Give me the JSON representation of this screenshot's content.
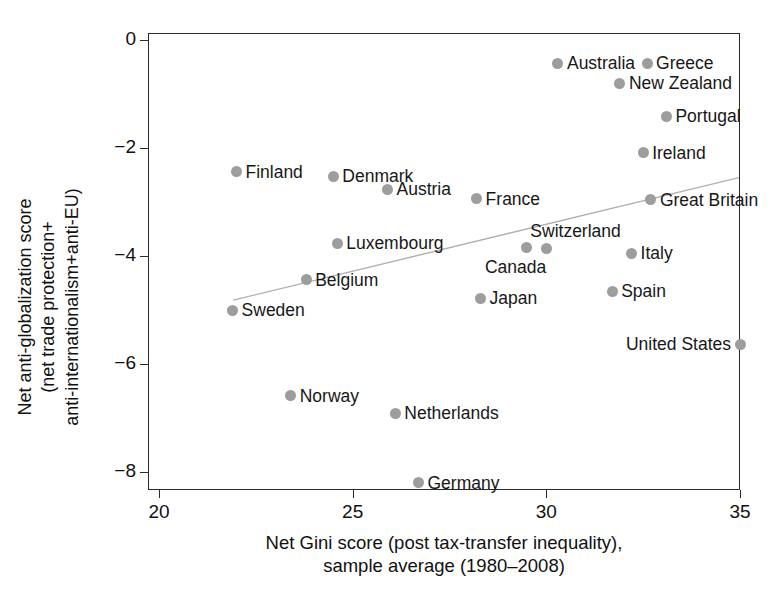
{
  "chart_data": {
    "type": "scatter",
    "title": "",
    "xlabel": "Net Gini score (post tax-transfer inequality),\nsample average (1980–2008)",
    "xlabel_line1": "Net Gini score (post tax-transfer inequality),",
    "xlabel_line2": "sample average (1980–2008)",
    "ylabel": "Net anti-globalization score\n(net trade protection+\nanti-internationalism+anti-EU)",
    "ylabel_line1": "Net anti-globalization score",
    "ylabel_line2": "(net trade protection+",
    "ylabel_line3": "anti-internationalism+anti-EU)",
    "xlim": [
      19.7,
      35.0
    ],
    "ylim": [
      -8.45,
      0.35
    ],
    "xticks": [
      20,
      25,
      30,
      35
    ],
    "xtick_labels": [
      "20",
      "25",
      "30",
      "35"
    ],
    "yticks": [
      0,
      -2,
      -4,
      -6,
      -8
    ],
    "ytick_labels": [
      "0",
      "−2",
      "−4",
      "−6",
      "−8"
    ],
    "grid": false,
    "legend": "none",
    "marker_color": "#9d9d9d",
    "axis_color": "#2b2b2b",
    "trendline": {
      "visible": true,
      "color": "#b0b0b0",
      "x_start": 21.9,
      "y_start": -4.82,
      "x_end": 35.0,
      "y_end": -2.54
    },
    "points": [
      {
        "label": "Australia",
        "x": 30.3,
        "y": -0.43,
        "label_side": "right"
      },
      {
        "label": "Greece",
        "x": 32.6,
        "y": -0.43,
        "label_side": "right"
      },
      {
        "label": "New Zealand",
        "x": 31.9,
        "y": -0.8,
        "label_side": "right"
      },
      {
        "label": "Portugal",
        "x": 33.1,
        "y": -1.41,
        "label_side": "right"
      },
      {
        "label": "Ireland",
        "x": 32.5,
        "y": -2.09,
        "label_side": "right"
      },
      {
        "label": "Finland",
        "x": 22.0,
        "y": -2.44,
        "label_side": "right"
      },
      {
        "label": "Denmark",
        "x": 24.5,
        "y": -2.52,
        "label_side": "right"
      },
      {
        "label": "Austria",
        "x": 25.9,
        "y": -2.76,
        "label_side": "right"
      },
      {
        "label": "France",
        "x": 28.2,
        "y": -2.94,
        "label_side": "right"
      },
      {
        "label": "Great Britain",
        "x": 32.7,
        "y": -2.96,
        "label_side": "right"
      },
      {
        "label": "Luxembourg",
        "x": 24.6,
        "y": -3.76,
        "label_side": "right"
      },
      {
        "label": "Canada",
        "x": 29.5,
        "y": -3.85,
        "label_side": "below"
      },
      {
        "label": "Switzerland",
        "x": 30.0,
        "y": -3.87,
        "label_side": "above"
      },
      {
        "label": "Italy",
        "x": 32.2,
        "y": -3.95,
        "label_side": "right"
      },
      {
        "label": "Belgium",
        "x": 23.8,
        "y": -4.44,
        "label_side": "right"
      },
      {
        "label": "Spain",
        "x": 31.7,
        "y": -4.65,
        "label_side": "right"
      },
      {
        "label": "Japan",
        "x": 28.3,
        "y": -4.78,
        "label_side": "right"
      },
      {
        "label": "Sweden",
        "x": 21.9,
        "y": -5.0,
        "label_side": "right"
      },
      {
        "label": "United States",
        "x": 35.0,
        "y": -5.63,
        "label_side": "left"
      },
      {
        "label": "Norway",
        "x": 23.4,
        "y": -6.59,
        "label_side": "right"
      },
      {
        "label": "Netherlands",
        "x": 26.1,
        "y": -6.91,
        "label_side": "right"
      },
      {
        "label": "Germany",
        "x": 26.7,
        "y": -8.2,
        "label_side": "right"
      }
    ]
  }
}
